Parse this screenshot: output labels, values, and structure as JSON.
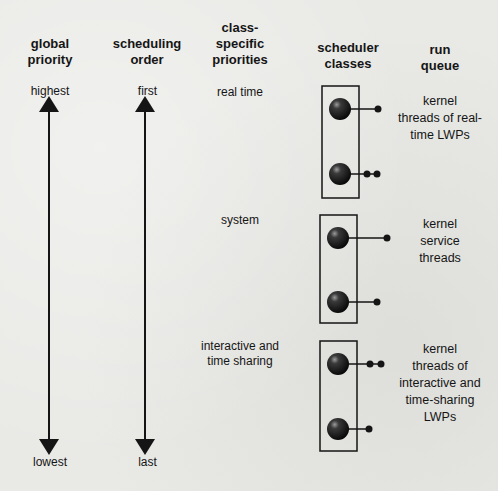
{
  "headers": {
    "global_priority": [
      "global",
      "priority"
    ],
    "scheduling_order": [
      "scheduling",
      "order"
    ],
    "class_specific": [
      "class-",
      "specific",
      "priorities"
    ],
    "scheduler_classes": [
      "scheduler",
      "classes"
    ],
    "run_queue": [
      "run",
      "queue"
    ]
  },
  "axis": {
    "global_top": "highest",
    "global_bottom": "lowest",
    "order_top": "first",
    "order_bottom": "last"
  },
  "classes": [
    {
      "label": "real time",
      "run_queue": [
        "kernel",
        "threads of real-",
        "time LWPs"
      ]
    },
    {
      "label": "system",
      "run_queue": [
        "kernel",
        "service",
        "threads"
      ]
    },
    {
      "label": "interactive and time sharing",
      "label_lines": [
        "interactive and",
        "time sharing"
      ],
      "run_queue": [
        "kernel",
        "threads of",
        "interactive and",
        "time-sharing",
        "LWPs"
      ]
    }
  ],
  "colors": {
    "ink": "#151515",
    "background": "#e9e9e6"
  }
}
